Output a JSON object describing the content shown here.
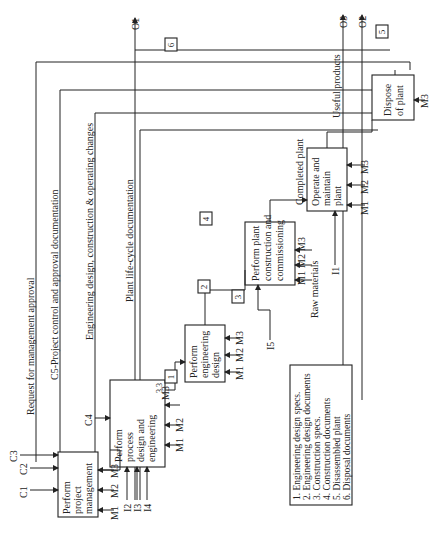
{
  "activities": [
    {
      "id": "A1",
      "label": [
        "Perform",
        "project",
        "management"
      ]
    },
    {
      "id": "A2",
      "label": [
        "Perform",
        "process",
        "design and",
        "engineering"
      ],
      "number": "3.3"
    },
    {
      "id": "A3",
      "label": [
        "Perform",
        "engineering",
        "design"
      ]
    },
    {
      "id": "A4",
      "label": [
        "Perform plant",
        "construction and",
        "commissioning"
      ]
    },
    {
      "id": "A5",
      "label": [
        "Operate and",
        "maintain",
        "plant"
      ]
    },
    {
      "id": "A6",
      "label": [
        "Dispose",
        "of plant"
      ]
    }
  ],
  "controls": {
    "c1": "C1",
    "c2": "C2",
    "c3": "C3",
    "c4": "C4"
  },
  "inputs": {
    "i1": "I1",
    "i2": "I2",
    "i3": "I3",
    "i4": "I4",
    "i5": "I5"
  },
  "outputs": {
    "o1": "O1",
    "o2": "O2",
    "o3": "O3"
  },
  "mechanisms": {
    "m1": "M1",
    "m2": "M2",
    "m3": "M3"
  },
  "flows": {
    "request": "Request for management approval",
    "c5": "C5-Project control and approval documentation",
    "eng_changes": "Engineering design, construction & operating changes",
    "lifecycle": "Plant life-cycle documentation",
    "completed": "Completed plant",
    "raw": "Raw materials",
    "useful": "Useful products"
  },
  "tags": [
    "1",
    "2",
    "3",
    "4",
    "5",
    "6"
  ],
  "legend": [
    "1. Engineering design specs.",
    "2. Engineering design documents",
    "3. Construction specs.",
    "4. Construction documents",
    "5. Disassembled plant",
    "6. Disposal documents"
  ]
}
